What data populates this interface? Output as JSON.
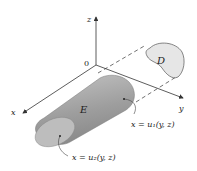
{
  "figure": {
    "labels": {
      "z_axis": "z",
      "y_axis": "y",
      "x_axis": "x",
      "origin": "0",
      "region_D": "D",
      "solid_E": "E",
      "surface_u1": "x = u₁(y, z)",
      "surface_u2": "x = u₂(y, z)"
    },
    "colors": {
      "solid_fill": "#a8a8a8",
      "solid_end": "#c9c9c9",
      "region_fill": "#e6e6e6",
      "axis": "#333333"
    }
  }
}
